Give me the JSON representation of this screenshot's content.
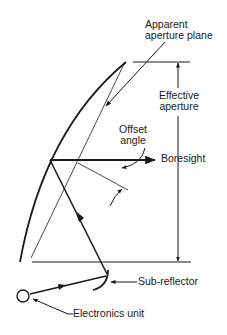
{
  "diagram": {
    "type": "offset-fed reflector antenna geometry",
    "labels": {
      "apparent_aperture_plane_line1": "Apparent",
      "apparent_aperture_plane_line2": "aperture plane",
      "effective_aperture_line1": "Effective",
      "effective_aperture_line2": "aperture",
      "offset_angle_line1": "Offset",
      "offset_angle_line2": "angle",
      "boresight": "Boresight",
      "sub_reflector": "Sub-reflector",
      "electronics_unit": "Electronics unit"
    },
    "components": [
      {
        "id": "main-reflector",
        "shape": "parabolic-curve"
      },
      {
        "id": "apparent-aperture-plane",
        "shape": "thin-line"
      },
      {
        "id": "effective-aperture-dimension",
        "shape": "double-arrow-dimension"
      },
      {
        "id": "boresight-axis",
        "shape": "arrow"
      },
      {
        "id": "offset-angle-indicator",
        "shape": "angle-arrows"
      },
      {
        "id": "sub-reflector",
        "shape": "arc"
      },
      {
        "id": "electronics-unit",
        "shape": "circle"
      },
      {
        "id": "signal-path",
        "shape": "arrowed-ray"
      }
    ],
    "colors": {
      "stroke": "#1a1a1a",
      "background": "#ffffff"
    }
  }
}
